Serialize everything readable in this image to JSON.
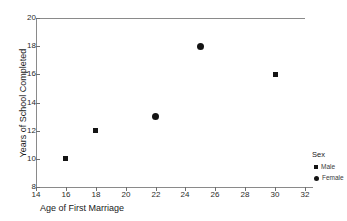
{
  "chart_data": {
    "type": "scatter",
    "title": "",
    "xlabel": "Age of First Marriage",
    "ylabel": "Years of School Completed",
    "xlim": [
      14,
      32
    ],
    "ylim": [
      8,
      20
    ],
    "xticks": [
      14,
      16,
      18,
      20,
      22,
      24,
      26,
      28,
      30,
      32
    ],
    "yticks": [
      8,
      10,
      12,
      14,
      16,
      18,
      20
    ],
    "grid": false,
    "legend": {
      "title": "Sex",
      "position": "right-outside",
      "entries": [
        {
          "name": "Male",
          "marker": "square",
          "color": "#141414"
        },
        {
          "name": "Female",
          "marker": "circle",
          "color": "#141414"
        }
      ]
    },
    "series": [
      {
        "name": "Male",
        "marker": "square",
        "color": "#141414",
        "points": [
          {
            "x": 16,
            "y": 10
          },
          {
            "x": 18,
            "y": 12
          },
          {
            "x": 30,
            "y": 16
          }
        ]
      },
      {
        "name": "Female",
        "marker": "circle",
        "color": "#141414",
        "points": [
          {
            "x": 22,
            "y": 13
          },
          {
            "x": 25,
            "y": 18
          }
        ]
      }
    ]
  },
  "axes": {
    "x_title": "Age of First Marriage",
    "y_title": "Years of School Completed",
    "x_tick_labels": [
      "14",
      "16",
      "18",
      "20",
      "22",
      "24",
      "26",
      "28",
      "30",
      "32"
    ],
    "y_tick_labels": [
      "8",
      "10",
      "12",
      "14",
      "16",
      "18",
      "20"
    ]
  },
  "legend": {
    "title": "Sex",
    "male_label": "Male",
    "female_label": "Female"
  },
  "colors": {
    "marker": "#141414",
    "axis": "#8a8a8a",
    "tick": "#6e6e6e",
    "text": "#1a1a1a",
    "background": "#ffffff"
  }
}
